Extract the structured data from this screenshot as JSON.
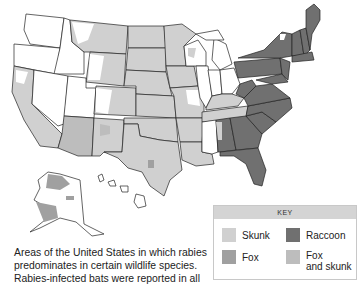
{
  "caption": {
    "line1": "Areas of the United States in which rabies",
    "line2": "predominates in certain wildlife species.",
    "line3": "Rabies-infected bats were reported in all"
  },
  "key": {
    "title": "KEY",
    "items": [
      {
        "label": "Skunk",
        "color": "#d0d0d0"
      },
      {
        "label": "Raccoon",
        "color": "#707070"
      },
      {
        "label": "Fox",
        "color": "#a0a0a0"
      },
      {
        "label": "Fox and skunk",
        "line1": "Fox",
        "line2": "and skunk",
        "color": "#bdbdbd"
      }
    ]
  },
  "map": {
    "title": "Rabies reservoir species by region, United States",
    "colors": {
      "none": "#ffffff",
      "skunk": "#d0d0d0",
      "raccoon": "#707070",
      "fox": "#a0a0a0",
      "fox_and_skunk": "#bdbdbd",
      "border": "#222222"
    }
  },
  "cutoff_text": "· · ·"
}
